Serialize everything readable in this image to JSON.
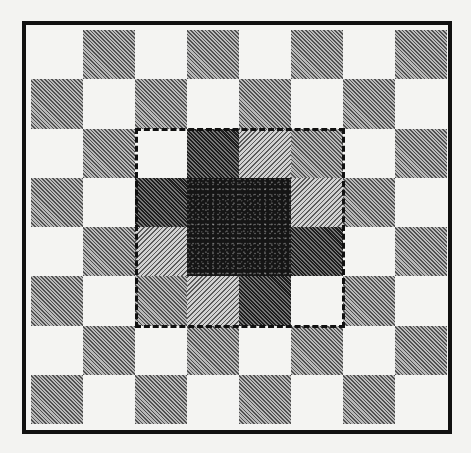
{
  "figure": {
    "type": "checkerboard-diagram",
    "grid": {
      "rows": 8,
      "cols": 8
    },
    "colors": {
      "background": "#f3f3f1",
      "frame": "#111111",
      "light": "#f4f4f2",
      "medium": "#8a8a8a",
      "darkgrey": "#4a4a4a",
      "lighthatch": "#a8a8a8",
      "black": "#151515",
      "highlight_dash": "#111111"
    },
    "highlight_region": {
      "row_start": 2,
      "row_end": 5,
      "col_start": 2,
      "col_end": 5,
      "style": "dashed"
    },
    "cells": [
      [
        "light",
        "medium",
        "light",
        "medium",
        "light",
        "medium",
        "light",
        "medium"
      ],
      [
        "medium",
        "light",
        "medium",
        "light",
        "medium",
        "light",
        "medium",
        "light"
      ],
      [
        "light",
        "medium",
        "light",
        "darkgrey",
        "lighthatch",
        "medium",
        "light",
        "medium"
      ],
      [
        "medium",
        "light",
        "darkgrey",
        "black",
        "black",
        "lighthatch",
        "medium",
        "light"
      ],
      [
        "light",
        "medium",
        "lighthatch",
        "black",
        "black",
        "darkgrey",
        "light",
        "medium"
      ],
      [
        "medium",
        "light",
        "medium",
        "lighthatch",
        "darkgrey",
        "light",
        "medium",
        "light"
      ],
      [
        "light",
        "medium",
        "light",
        "medium",
        "light",
        "medium",
        "light",
        "medium"
      ],
      [
        "medium",
        "light",
        "medium",
        "light",
        "medium",
        "light",
        "medium",
        "light"
      ]
    ]
  }
}
